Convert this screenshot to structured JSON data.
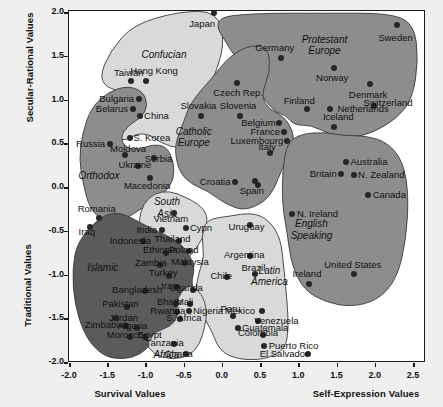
{
  "chart_data": {
    "type": "scatter",
    "xlabel_left": "Survival Values",
    "xlabel_right": "Self-Expression Values",
    "ylabel_top": "Secular-Rational Values",
    "ylabel_bottom": "Traditional Values",
    "xlim": [
      -2.0,
      2.75
    ],
    "ylim": [
      -2.0,
      2.0
    ],
    "xticks": [
      "-2.0",
      "-1.5",
      "-1.0",
      "-0.5",
      "0.0",
      "0.5",
      "1.0",
      "1.5",
      "2.0",
      "2.5"
    ],
    "xtickvals": [
      -2.0,
      -1.5,
      -1.0,
      -0.5,
      0.0,
      0.5,
      1.0,
      1.5,
      2.0,
      2.5
    ],
    "yticks": [
      "2.0",
      "1.5",
      "1.0",
      "0.5",
      "0.0",
      "-0.5",
      "-1.0",
      "-1.5",
      "-2.0"
    ],
    "ytickvals": [
      2.0,
      1.5,
      1.0,
      0.5,
      0.0,
      -0.5,
      -1.0,
      -1.5,
      -2.0
    ],
    "grid": false,
    "legend": "none",
    "colors": {
      "light": "#d9d9d9",
      "medium": "#8d8d8d",
      "dark": "#5b5b5b",
      "dot": "#262626",
      "frame": "#1a1a1a",
      "background": "#ffffff"
    },
    "groups": [
      {
        "name": "Confucian",
        "shade": "light",
        "lx": -0.75,
        "ly": 1.5
      },
      {
        "name": "Protestant\nEurope",
        "shade": "medium",
        "lx": 1.35,
        "ly": 1.62
      },
      {
        "name": "Catholic\nEurope",
        "shade": "medium",
        "lx": -0.36,
        "ly": 0.57
      },
      {
        "name": "Orthodox",
        "shade": "medium",
        "lx": -1.6,
        "ly": 0.12
      },
      {
        "name": "English\nSpeaking",
        "shade": "medium",
        "lx": 1.18,
        "ly": -0.49
      },
      {
        "name": "South\nAsia",
        "shade": "light",
        "lx": -0.71,
        "ly": -0.24
      },
      {
        "name": "Latin\nAmerica",
        "shade": "light",
        "lx": 0.63,
        "ly": -1.02
      },
      {
        "name": "Islamic",
        "shade": "dark",
        "lx": -1.55,
        "ly": -0.93
      },
      {
        "name": "Africa",
        "shade": "light",
        "lx": -0.72,
        "ly": -1.93
      }
    ],
    "points": [
      {
        "c": "Japan",
        "x": -0.1,
        "y": 1.98,
        "lx": -0.25,
        "ly": 1.86,
        "a": "c"
      },
      {
        "c": "Sweden",
        "x": 2.3,
        "y": 1.85,
        "lx": 2.28,
        "ly": 1.7,
        "a": "c"
      },
      {
        "c": "Taiwan",
        "x": -1.18,
        "y": 1.2,
        "lx": -1.21,
        "ly": 1.3,
        "a": "c"
      },
      {
        "c": "Hong Kong",
        "x": -0.98,
        "y": 1.2,
        "lx": -0.88,
        "ly": 1.32,
        "a": "c"
      },
      {
        "c": "Germany",
        "x": 0.78,
        "y": 1.47,
        "lx": 0.7,
        "ly": 1.58,
        "a": "c"
      },
      {
        "c": "Norway",
        "x": 1.48,
        "y": 1.35,
        "lx": 1.45,
        "ly": 1.24,
        "a": "c"
      },
      {
        "c": "Czech Rep.",
        "x": 0.2,
        "y": 1.18,
        "lx": 0.22,
        "ly": 1.07,
        "a": "c"
      },
      {
        "c": "Denmark",
        "x": 1.94,
        "y": 1.17,
        "lx": 1.92,
        "ly": 1.05,
        "a": "c"
      },
      {
        "c": "Switzerland",
        "x": 2.0,
        "y": 0.92,
        "lx": 2.18,
        "ly": 0.95,
        "a": "c"
      },
      {
        "c": "Bulgaria",
        "x": -1.08,
        "y": 1.0,
        "lx": -1.14,
        "ly": 1.0,
        "a": "r"
      },
      {
        "c": "Belarus",
        "x": -1.16,
        "y": 0.88,
        "lx": -1.22,
        "ly": 0.88,
        "a": "r"
      },
      {
        "c": "Slovakia",
        "x": -0.27,
        "y": 0.8,
        "lx": -0.3,
        "ly": 0.92,
        "a": "c"
      },
      {
        "c": "Slovenia",
        "x": 0.25,
        "y": 0.8,
        "lx": 0.22,
        "ly": 0.92,
        "a": "c"
      },
      {
        "c": "Finland",
        "x": 1.12,
        "y": 0.88,
        "lx": 1.02,
        "ly": 0.98,
        "a": "c"
      },
      {
        "c": "Netherlands",
        "x": 1.42,
        "y": 0.88,
        "lx": 1.52,
        "ly": 0.88,
        "a": "l"
      },
      {
        "c": "China",
        "x": -1.06,
        "y": 0.8,
        "lx": -1.01,
        "ly": 0.8,
        "a": "l"
      },
      {
        "c": "Belgium",
        "x": 0.76,
        "y": 0.73,
        "lx": 0.71,
        "ly": 0.73,
        "a": "r"
      },
      {
        "c": "Iceland",
        "x": 1.47,
        "y": 0.68,
        "lx": 1.53,
        "ly": 0.79,
        "a": "c"
      },
      {
        "c": "France",
        "x": 0.82,
        "y": 0.62,
        "lx": 0.77,
        "ly": 0.62,
        "a": "r"
      },
      {
        "c": "S. Korea",
        "x": -1.2,
        "y": 0.55,
        "lx": -1.15,
        "ly": 0.55,
        "a": "l"
      },
      {
        "c": "Luxembourg",
        "x": 0.86,
        "y": 0.52,
        "lx": 0.81,
        "ly": 0.52,
        "a": "r"
      },
      {
        "c": "Russia",
        "x": -1.46,
        "y": 0.49,
        "lx": -1.52,
        "ly": 0.49,
        "a": "r"
      },
      {
        "c": "Italy",
        "x": 0.64,
        "y": 0.38,
        "lx": 0.6,
        "ly": 0.45,
        "a": "c"
      },
      {
        "c": "Moldova",
        "x": -1.26,
        "y": 0.36,
        "lx": -1.22,
        "ly": 0.43,
        "a": "c"
      },
      {
        "c": "Serbia",
        "x": -0.88,
        "y": 0.33,
        "lx": -0.82,
        "ly": 0.31,
        "a": "c"
      },
      {
        "c": "Australia",
        "x": 1.63,
        "y": 0.28,
        "lx": 1.69,
        "ly": 0.28,
        "a": "l"
      },
      {
        "c": "Ukraine",
        "x": -1.09,
        "y": 0.23,
        "lx": -1.13,
        "ly": 0.25,
        "a": "c"
      },
      {
        "c": "Britain",
        "x": 1.56,
        "y": 0.14,
        "lx": 1.51,
        "ly": 0.14,
        "a": "r"
      },
      {
        "c": "N. Zealand",
        "x": 1.74,
        "y": 0.13,
        "lx": 1.79,
        "ly": 0.13,
        "a": "l"
      },
      {
        "c": "Macedonia",
        "x": -0.93,
        "y": 0.1,
        "lx": -0.97,
        "ly": 0.0,
        "a": "c"
      },
      {
        "c": "Croatia",
        "x": 0.18,
        "y": 0.05,
        "lx": 0.12,
        "ly": 0.05,
        "a": "r"
      },
      {
        "c": "Spain",
        "x": 0.44,
        "y": 0.06,
        "lx": 0.4,
        "ly": -0.05,
        "a": "c"
      },
      {
        "c": "Spain2",
        "x": 0.48,
        "y": 0.02,
        "lx": null,
        "ly": null,
        "a": "c"
      },
      {
        "c": "Canada",
        "x": 1.92,
        "y": -0.1,
        "lx": 1.98,
        "ly": -0.1,
        "a": "l"
      },
      {
        "c": "Romania",
        "x": -1.6,
        "y": -0.36,
        "lx": -1.63,
        "ly": -0.26,
        "a": "c"
      },
      {
        "c": "Vietnam",
        "x": -0.62,
        "y": -0.3,
        "lx": -0.66,
        "ly": -0.37,
        "a": "c"
      },
      {
        "c": "N. Ireland",
        "x": 0.93,
        "y": -0.31,
        "lx": 0.99,
        "ly": -0.31,
        "a": "l"
      },
      {
        "c": "Iraq",
        "x": -1.72,
        "y": -0.46,
        "lx": -1.76,
        "ly": -0.52,
        "a": "c"
      },
      {
        "c": "India",
        "x": -0.78,
        "y": -0.5,
        "lx": -0.84,
        "ly": -0.5,
        "a": "r"
      },
      {
        "c": "Cypn",
        "x": -0.46,
        "y": -0.48,
        "lx": -0.41,
        "ly": -0.48,
        "a": "l"
      },
      {
        "c": "Uruguay",
        "x": 0.38,
        "y": -0.44,
        "lx": 0.33,
        "ly": -0.46,
        "a": "c"
      },
      {
        "c": "Thailand",
        "x": -0.55,
        "y": -0.62,
        "lx": -0.64,
        "ly": -0.6,
        "a": "c"
      },
      {
        "c": "Indonesia",
        "x": -1.03,
        "y": -0.62,
        "lx": -1.19,
        "ly": -0.62,
        "a": "c"
      },
      {
        "c": "Ethiopia",
        "x": -0.72,
        "y": -0.76,
        "lx": -0.8,
        "ly": -0.73,
        "a": "c"
      },
      {
        "c": "Poland",
        "x": -0.42,
        "y": -0.74,
        "lx": -0.49,
        "ly": -0.73,
        "a": "c"
      },
      {
        "c": "Argentina",
        "x": 0.38,
        "y": -0.8,
        "lx": 0.3,
        "ly": -0.78,
        "a": "c"
      },
      {
        "c": "Malaysia",
        "x": -0.48,
        "y": -0.88,
        "lx": -0.41,
        "ly": -0.86,
        "a": "c"
      },
      {
        "c": "Zambia",
        "x": -0.8,
        "y": -0.9,
        "lx": -0.92,
        "ly": -0.88,
        "a": "c"
      },
      {
        "c": "Brazil",
        "x": 0.44,
        "y": -1.0,
        "lx": 0.42,
        "ly": -0.93,
        "a": "c"
      },
      {
        "c": "Turkey",
        "x": -0.68,
        "y": -1.02,
        "lx": -0.76,
        "ly": -0.99,
        "a": "c"
      },
      {
        "c": "Chile",
        "x": 0.08,
        "y": -1.03,
        "lx": 0.0,
        "ly": -1.02,
        "a": "c"
      },
      {
        "c": "Iran",
        "x": -0.58,
        "y": -1.15,
        "lx": -0.68,
        "ly": -1.14,
        "a": "c"
      },
      {
        "c": "Uganda",
        "x": -0.37,
        "y": -1.18,
        "lx": -0.46,
        "ly": -1.16,
        "a": "c"
      },
      {
        "c": "Bangladesh",
        "x": -1.0,
        "y": -1.2,
        "lx": -1.1,
        "ly": -1.18,
        "a": "c"
      },
      {
        "c": "Ireland",
        "x": 1.15,
        "y": -1.12,
        "lx": 1.12,
        "ly": -1.0,
        "a": "c"
      },
      {
        "c": "United States",
        "x": 1.74,
        "y": -1.0,
        "lx": 1.72,
        "ly": -0.9,
        "a": "c"
      },
      {
        "c": "Mali",
        "x": -0.41,
        "y": -1.34,
        "lx": -0.48,
        "ly": -1.32,
        "a": "c"
      },
      {
        "c": "Pakistan",
        "x": -1.23,
        "y": -1.38,
        "lx": -1.32,
        "ly": -1.34,
        "a": "c"
      },
      {
        "c": "Bhath",
        "x": -0.59,
        "y": -1.34,
        "lx": -0.68,
        "ly": -1.32,
        "a": "c"
      },
      {
        "c": "Nigeria",
        "x": -0.42,
        "y": -1.42,
        "lx": -0.37,
        "ly": -1.42,
        "a": "l"
      },
      {
        "c": "Rwanda",
        "x": -0.58,
        "y": -1.44,
        "lx": -0.7,
        "ly": -1.42,
        "a": "c"
      },
      {
        "c": "S. Africa",
        "x": -0.54,
        "y": -1.52,
        "lx": -0.49,
        "ly": -1.5,
        "a": "c"
      },
      {
        "c": "Jordan",
        "x": -1.38,
        "y": -1.5,
        "lx": -1.28,
        "ly": -1.5,
        "a": "c"
      },
      {
        "c": "Peru",
        "x": 0.15,
        "y": -1.48,
        "lx": 0.12,
        "ly": -1.4,
        "a": "c"
      },
      {
        "c": "Mexico",
        "x": 0.53,
        "y": -1.42,
        "lx": 0.44,
        "ly": -1.42,
        "a": "r"
      },
      {
        "c": "Zimbabwe",
        "x": -1.25,
        "y": -1.6,
        "lx": -1.5,
        "ly": -1.58,
        "a": "c"
      },
      {
        "c": "Algeria",
        "x": -1.1,
        "y": -1.62,
        "lx": -1.16,
        "ly": -1.6,
        "a": "c"
      },
      {
        "c": "Venezuela",
        "x": 0.48,
        "y": -1.54,
        "lx": 0.43,
        "ly": -1.54,
        "a": "l"
      },
      {
        "c": "Guatemala",
        "x": 0.22,
        "y": -1.62,
        "lx": 0.27,
        "ly": -1.62,
        "a": "l"
      },
      {
        "c": "Morocco",
        "x": -1.19,
        "y": -1.72,
        "lx": -1.26,
        "ly": -1.7,
        "a": "c"
      },
      {
        "c": "Egypt",
        "x": -1.0,
        "y": -1.72,
        "lx": -0.94,
        "ly": -1.7,
        "a": "c"
      },
      {
        "c": "Colombia",
        "x": 0.54,
        "y": -1.7,
        "lx": 0.48,
        "ly": -1.68,
        "a": "c"
      },
      {
        "c": "Tanzania",
        "x": -0.62,
        "y": -1.8,
        "lx": -0.74,
        "ly": -1.79,
        "a": "c"
      },
      {
        "c": "Puerto Rico",
        "x": 0.56,
        "y": -1.82,
        "lx": 0.62,
        "ly": -1.82,
        "a": "l"
      },
      {
        "c": "Ghana",
        "x": -0.46,
        "y": -1.92,
        "lx": -0.56,
        "ly": -1.91,
        "a": "c"
      },
      {
        "c": "El Salvador",
        "x": 1.14,
        "y": -1.92,
        "lx": 0.82,
        "ly": -1.91,
        "a": "c"
      }
    ]
  }
}
